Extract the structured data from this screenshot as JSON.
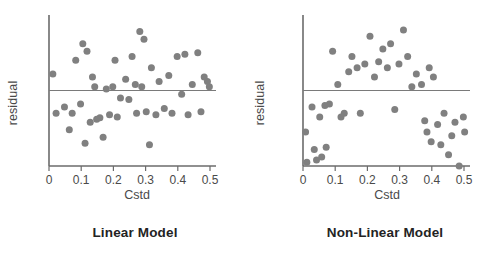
{
  "figure": {
    "background_color": "#ffffff",
    "axis_color": "#6b6b6b",
    "point_color": "#808080",
    "refline_color": "#7a7a7a",
    "text_color": "#4a4a4a",
    "caption_color": "#232323"
  },
  "panels": [
    {
      "id": "linear-model",
      "caption": "Linear Model",
      "ylabel": "residual",
      "xlabel": "Cstd"
    },
    {
      "id": "non-linear-model",
      "caption": "Non-Linear Model",
      "ylabel": "residual",
      "xlabel": "Cstd"
    }
  ],
  "chart_data": [
    {
      "type": "scatter",
      "title": "Linear Model",
      "xlabel": "Cstd",
      "ylabel": "residual",
      "xlim": [
        0,
        0.5
      ],
      "ylim": [
        -1,
        1
      ],
      "xticks": [
        0,
        0.1,
        0.2,
        0.3,
        0.4,
        0.5
      ],
      "xticklabels": [
        "0",
        "0.1",
        "0.2",
        "0.3",
        "0.4",
        "0.5"
      ],
      "yticks": [],
      "yticklabels": [],
      "grid": false,
      "legend": null,
      "reference_line": {
        "type": "horizontal",
        "y": 0,
        "label": "zero residual"
      },
      "point_color": "#808080",
      "point_size": 7,
      "x": [
        0.012,
        0.022,
        0.048,
        0.063,
        0.072,
        0.083,
        0.098,
        0.105,
        0.112,
        0.118,
        0.128,
        0.135,
        0.142,
        0.148,
        0.158,
        0.168,
        0.178,
        0.188,
        0.198,
        0.205,
        0.212,
        0.222,
        0.238,
        0.248,
        0.258,
        0.268,
        0.272,
        0.282,
        0.288,
        0.295,
        0.302,
        0.312,
        0.318,
        0.332,
        0.342,
        0.358,
        0.372,
        0.382,
        0.398,
        0.412,
        0.422,
        0.432,
        0.445,
        0.462,
        0.472,
        0.482,
        0.492,
        0.498
      ],
      "y": [
        0.22,
        -0.3,
        -0.22,
        -0.52,
        -0.3,
        0.4,
        -0.18,
        0.62,
        -0.7,
        0.52,
        -0.42,
        0.18,
        0.05,
        -0.38,
        -0.36,
        -0.62,
        0.02,
        -0.32,
        0.05,
        0.4,
        -0.35,
        -0.1,
        0.15,
        -0.12,
        0.45,
        0.08,
        -0.3,
        0.78,
        0.05,
        0.68,
        -0.28,
        -0.72,
        0.3,
        -0.32,
        0.12,
        -0.24,
        0.2,
        -0.3,
        0.45,
        -0.05,
        0.48,
        -0.32,
        0.08,
        0.5,
        -0.28,
        0.18,
        0.12,
        0.05
      ]
    },
    {
      "type": "scatter",
      "title": "Non-Linear Model",
      "xlabel": "Cstd",
      "ylabel": "residual",
      "xlim": [
        0,
        0.5
      ],
      "ylim": [
        -1,
        1
      ],
      "xticks": [
        0,
        0.1,
        0.2,
        0.3,
        0.4,
        0.5
      ],
      "xticklabels": [
        "0",
        "0.1",
        "0.2",
        "0.3",
        "0.4",
        "0.5"
      ],
      "yticks": [],
      "yticklabels": [],
      "grid": false,
      "legend": null,
      "reference_line": {
        "type": "horizontal",
        "y": 0,
        "label": "zero residual"
      },
      "point_color": "#808080",
      "point_size": 7,
      "x": [
        0.008,
        0.012,
        0.028,
        0.035,
        0.042,
        0.052,
        0.058,
        0.068,
        0.072,
        0.082,
        0.092,
        0.108,
        0.118,
        0.128,
        0.142,
        0.152,
        0.168,
        0.178,
        0.192,
        0.208,
        0.222,
        0.235,
        0.248,
        0.262,
        0.272,
        0.285,
        0.298,
        0.312,
        0.325,
        0.338,
        0.352,
        0.368,
        0.378,
        0.385,
        0.392,
        0.398,
        0.405,
        0.418,
        0.428,
        0.438,
        0.452,
        0.462,
        0.472,
        0.485,
        0.498,
        0.502
      ],
      "y": [
        -0.55,
        -0.95,
        -0.22,
        -0.78,
        -0.92,
        -0.35,
        -0.88,
        -0.2,
        -0.75,
        -0.18,
        0.52,
        0.08,
        -0.35,
        -0.3,
        0.25,
        0.45,
        0.3,
        -0.3,
        0.35,
        0.72,
        0.18,
        0.38,
        0.55,
        0.3,
        0.62,
        -0.25,
        0.35,
        0.8,
        0.45,
        0.05,
        0.22,
        0.08,
        -0.4,
        -0.55,
        0.3,
        -0.68,
        0.18,
        -0.45,
        -0.72,
        -0.3,
        -0.85,
        -0.6,
        -0.42,
        -1.0,
        -0.35,
        -0.55
      ]
    }
  ]
}
